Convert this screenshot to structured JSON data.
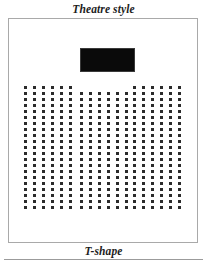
{
  "page": {
    "title": "Theatre style",
    "caption": "T-shape",
    "background_color": "#ffffff"
  },
  "room": {
    "frame_color": "#a9a9a9"
  },
  "stage": {
    "label": "stage",
    "color": "#0a0a0a"
  },
  "seating": {
    "seat_color": "#2b2b2b",
    "seat_size_px": 3,
    "column_gap_px": 6,
    "row_gap_px": 3,
    "blocks": [
      {
        "name": "left",
        "columns": 6,
        "rows": 21
      },
      {
        "name": "center",
        "columns": 6,
        "rows": 20
      },
      {
        "name": "right",
        "columns": 6,
        "rows": 21
      }
    ]
  },
  "chart_data": {
    "type": "table",
    "title": "Theatre style",
    "subtitle": "T-shape",
    "categories": [
      "left block",
      "center block",
      "right block"
    ],
    "values": [
      126,
      120,
      126
    ],
    "series": [
      {
        "name": "columns",
        "values": [
          6,
          6,
          6
        ]
      },
      {
        "name": "rows",
        "values": [
          21,
          20,
          21
        ]
      },
      {
        "name": "seats",
        "values": [
          126,
          120,
          126
        ]
      }
    ],
    "total_seats": 372,
    "xlabel": "seating block",
    "ylabel": "seats"
  }
}
